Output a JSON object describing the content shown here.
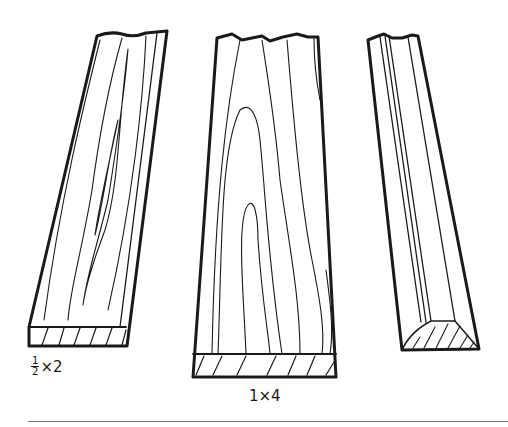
{
  "figure": {
    "boards": [
      {
        "id": "board-half-by-two",
        "label_numerator": "1",
        "label_denominator": "2",
        "label_suffix": "×2"
      },
      {
        "id": "board-one-by-four",
        "label": "1×4"
      },
      {
        "id": "molding-strip",
        "label": ""
      }
    ],
    "colors": {
      "ink": "#1a1a1a",
      "rule": "#777777",
      "background": "#ffffff"
    }
  }
}
